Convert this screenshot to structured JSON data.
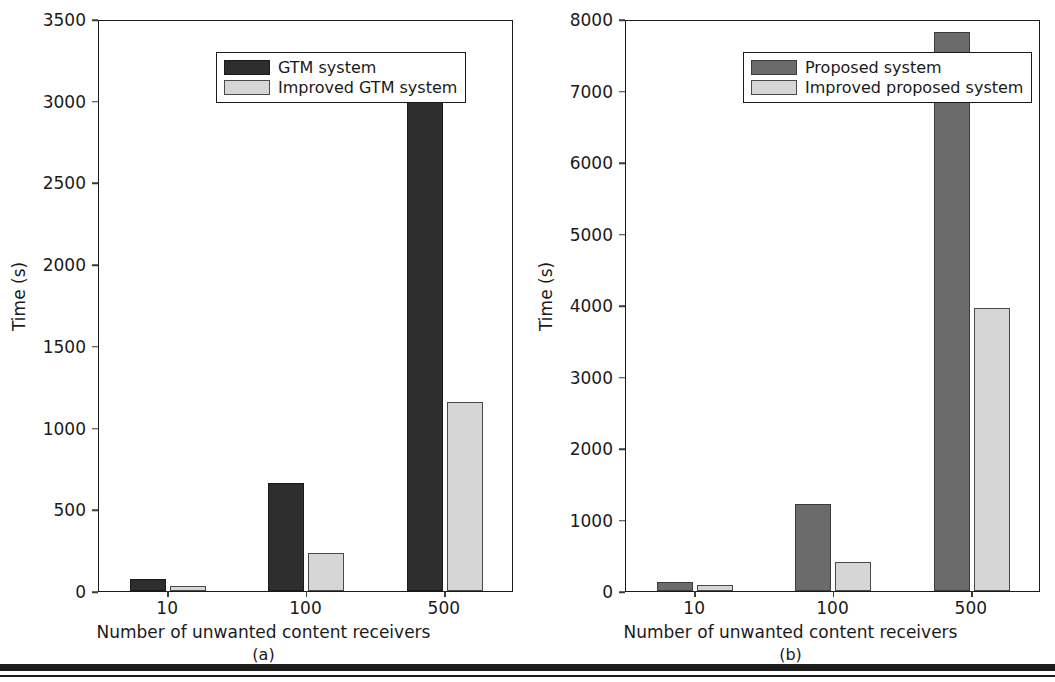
{
  "figure": {
    "panels": [
      {
        "caption": "(a)",
        "xlabel": "Number of unwanted content receivers",
        "ylabel": "Time (s)",
        "legend": [
          {
            "label": "GTM system",
            "swatch": "dark-a"
          },
          {
            "label": "Improved GTM system",
            "swatch": "light-a"
          }
        ],
        "yticks": [
          "0",
          "500",
          "1000",
          "1500",
          "2000",
          "2500",
          "3000",
          "3500"
        ],
        "xticks": [
          "10",
          "100",
          "500"
        ]
      },
      {
        "caption": "(b)",
        "xlabel": "Number of unwanted content receivers",
        "ylabel": "Time (s)",
        "legend": [
          {
            "label": "Proposed system",
            "swatch": "dark-b"
          },
          {
            "label": "Improved proposed system",
            "swatch": "light-b"
          }
        ],
        "yticks": [
          "0",
          "1000",
          "2000",
          "3000",
          "4000",
          "5000",
          "6000",
          "7000",
          "8000"
        ],
        "xticks": [
          "10",
          "100",
          "500"
        ]
      }
    ]
  },
  "colors": {
    "dark_a": "#2e2e2e",
    "light_a": "#d6d6d6",
    "dark_b": "#6b6b6b",
    "light_b": "#d6d6d6",
    "axis": "#1a1a1a",
    "background": "#ffffff"
  },
  "chart_data": [
    {
      "type": "bar",
      "title": "",
      "subtitle": "(a)",
      "xlabel": "Number of unwanted content receivers",
      "ylabel": "Time (s)",
      "categories": [
        "10",
        "100",
        "500"
      ],
      "series": [
        {
          "name": "GTM system",
          "values": [
            75,
            660,
            3150
          ],
          "color": "#2e2e2e"
        },
        {
          "name": "Improved GTM system",
          "values": [
            30,
            230,
            1155
          ],
          "color": "#d6d6d6"
        }
      ],
      "ylim": [
        0,
        3500
      ],
      "yticks": [
        0,
        500,
        1000,
        1500,
        2000,
        2500,
        3000,
        3500
      ],
      "grid": false,
      "legend_position": "upper left"
    },
    {
      "type": "bar",
      "title": "",
      "subtitle": "(b)",
      "xlabel": "Number of unwanted content receivers",
      "ylabel": "Time (s)",
      "categories": [
        "10",
        "100",
        "500"
      ],
      "series": [
        {
          "name": "Proposed system",
          "values": [
            120,
            1215,
            7820
          ],
          "color": "#6b6b6b"
        },
        {
          "name": "Improved proposed system",
          "values": [
            85,
            405,
            3960
          ],
          "color": "#d6d6d6"
        }
      ],
      "ylim": [
        0,
        8000
      ],
      "yticks": [
        0,
        1000,
        2000,
        3000,
        4000,
        5000,
        6000,
        7000,
        8000
      ],
      "grid": false,
      "legend_position": "upper left"
    }
  ]
}
